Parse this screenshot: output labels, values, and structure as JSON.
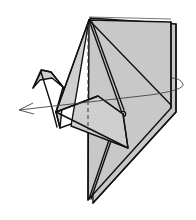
{
  "diagram": {
    "step": "turn model over",
    "colors": {
      "paper": "#c8c8c8",
      "outline": "#111111",
      "arrow": "#444444",
      "background": "#ffffff"
    },
    "elements": [
      {
        "name": "crane-body",
        "description": "folded paper crane body with layered flaps"
      },
      {
        "name": "crane-head",
        "description": "neck and head flap on left"
      },
      {
        "name": "crane-wing",
        "description": "front wing triangle"
      },
      {
        "name": "valley-fold-line",
        "description": "vertical dashed fold line"
      },
      {
        "name": "turn-over-arrow",
        "description": "elliptical rotation arrow pointing left"
      }
    ]
  }
}
